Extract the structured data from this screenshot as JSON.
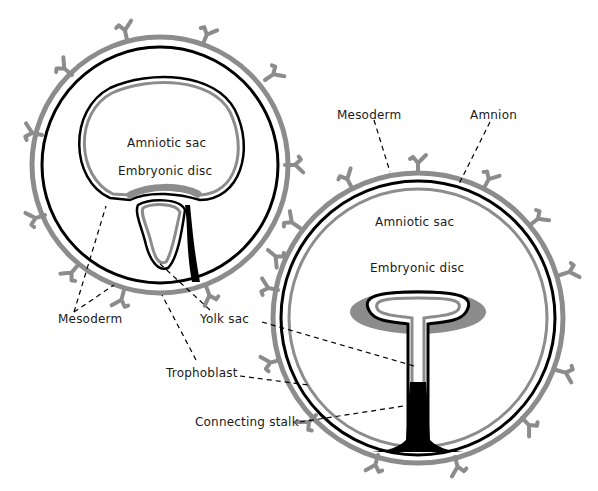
{
  "diagram": {
    "left_figure": {
      "labels": {
        "amniotic_sac": "Amniotic sac",
        "embryonic_disc": "Embryonic disc"
      }
    },
    "right_figure": {
      "labels": {
        "mesoderm": "Mesoderm",
        "amnion": "Amnion",
        "amniotic_sac": "Amniotic sac",
        "embryonic_disc": "Embryonic disc"
      }
    },
    "shared_labels": {
      "mesoderm": "Mesoderm",
      "yolk_sac": "Yolk sac",
      "trophoblast": "Trophoblast",
      "connecting_stalk": "Connecting stalk"
    },
    "colors": {
      "outline": "#000000",
      "membrane_gray": "#8c8c8c",
      "background": "#ffffff"
    }
  }
}
